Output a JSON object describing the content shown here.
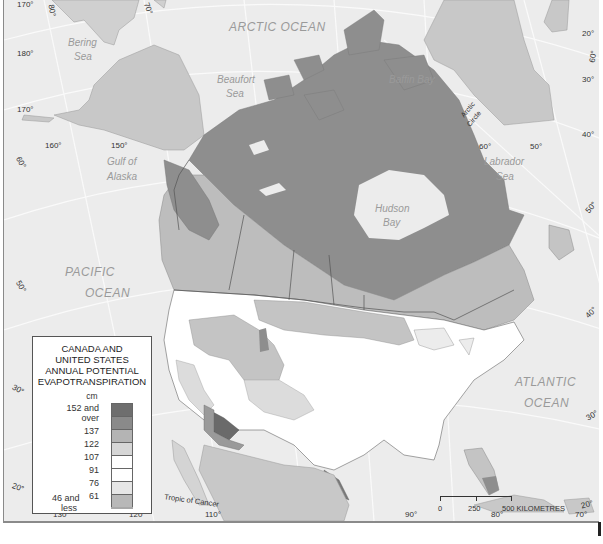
{
  "map": {
    "title": "CANADA AND UNITED STATES ANNUAL POTENTIAL EVAPOTRANSPIRATION",
    "water_labels": {
      "arctic_ocean": "ARCTIC OCEAN",
      "bering_sea_1": "Bering",
      "bering_sea_2": "Sea",
      "beaufort_sea_1": "Beaufort",
      "beaufort_sea_2": "Sea",
      "baffin_bay": "Baffin Bay",
      "gulf_of_alaska_1": "Gulf of",
      "gulf_of_alaska_2": "Alaska",
      "labrador_sea_1": "Labrador",
      "labrador_sea_2": "Sea",
      "hudson_bay_1": "Hudson",
      "hudson_bay_2": "Bay",
      "pacific_ocean_1": "PACIFIC",
      "pacific_ocean_2": "OCEAN",
      "atlantic_ocean_1": "ATLANTIC",
      "atlantic_ocean_2": "OCEAN"
    },
    "line_labels": {
      "arctic_circle_1": "Arctic",
      "arctic_circle_2": "Circle",
      "tropic_of_cancer": "Tropic of Cancer"
    },
    "graticule_labels": {
      "left": [
        "170°",
        "180°",
        "170°",
        "160°",
        "150°"
      ],
      "left_lat": [
        "60°",
        "50°",
        "40°",
        "30°",
        "20°"
      ],
      "top": [
        "80°",
        "70°"
      ],
      "right": [
        "20°",
        "30°",
        "40°"
      ],
      "right_lat": [
        "60°",
        "50°",
        "40°",
        "30°",
        "20°"
      ],
      "inner": [
        "60°",
        "50°"
      ],
      "bottom": [
        "130°",
        "120°",
        "110°",
        "90°",
        "80°",
        "70°"
      ]
    },
    "legend": {
      "title_lines": [
        "CANADA AND",
        "UNITED STATES",
        "ANNUAL POTENTIAL",
        "EVAPOTRANSPIRATION"
      ],
      "unit": "cm",
      "classes": [
        {
          "label": "152 and over",
          "label_1": "152 and",
          "label_2": "over",
          "color": "#6e6e6e"
        },
        {
          "label": "137",
          "color": "#8a8a8a"
        },
        {
          "label": "122",
          "color": "#b4b4b4"
        },
        {
          "label": "107",
          "color": "#d6d6d6"
        },
        {
          "label": "91",
          "color": "#ffffff"
        },
        {
          "label": "76",
          "color": "#ffffff"
        },
        {
          "label": "61",
          "color": "#e6e6e6"
        },
        {
          "label": "46 and less",
          "label_1": "46 and",
          "label_2": "less",
          "color": "#a8a8a8"
        }
      ],
      "class_breaks": [
        "152 and over",
        "137",
        "122",
        "107",
        "91",
        "76",
        "61",
        "46 and less"
      ]
    },
    "scale_bar": {
      "ticks": [
        "0",
        "250",
        "500 KILOMETRES"
      ],
      "unit": "KILOMETRES"
    },
    "colors": {
      "water": "#ececec",
      "foreign_land": "#c8c8c8",
      "zone_dark": "#8e8e8e",
      "zone_mid": "#b4b4b4",
      "zone_light": "#d2d2d2",
      "zone_white": "#ffffff",
      "zone_darkest": "#666666",
      "graticule": "#fafafa",
      "border": "#555555"
    }
  }
}
